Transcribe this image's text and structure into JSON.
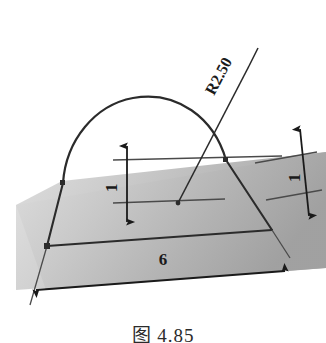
{
  "figure": {
    "caption": "图 4.85",
    "background_color": "#ffffff",
    "line_color": "#1a1a1a",
    "plane_fill_light": "#e8e8e8",
    "plane_fill_dark": "#a8a8a8"
  },
  "dimensions": {
    "radius": {
      "label": "R2.50",
      "name": "arc-radius-dimension",
      "rotation_deg": -62
    },
    "height_left": {
      "label": "1",
      "name": "left-height-dimension",
      "rotation_deg": -90
    },
    "height_right": {
      "label": "1",
      "name": "right-height-dimension",
      "rotation_deg": -90
    },
    "width_bottom": {
      "label": "6",
      "name": "bottom-width-dimension",
      "rotation_deg": 0
    }
  },
  "geometry": {
    "arc_name": "profile-arc",
    "left_edge_name": "profile-left-edge",
    "right_edge_name": "profile-right-edge",
    "base_line_name": "profile-base-line",
    "center_point_name": "arc-center-point",
    "sketch_plane_name": "sketch-plane"
  }
}
